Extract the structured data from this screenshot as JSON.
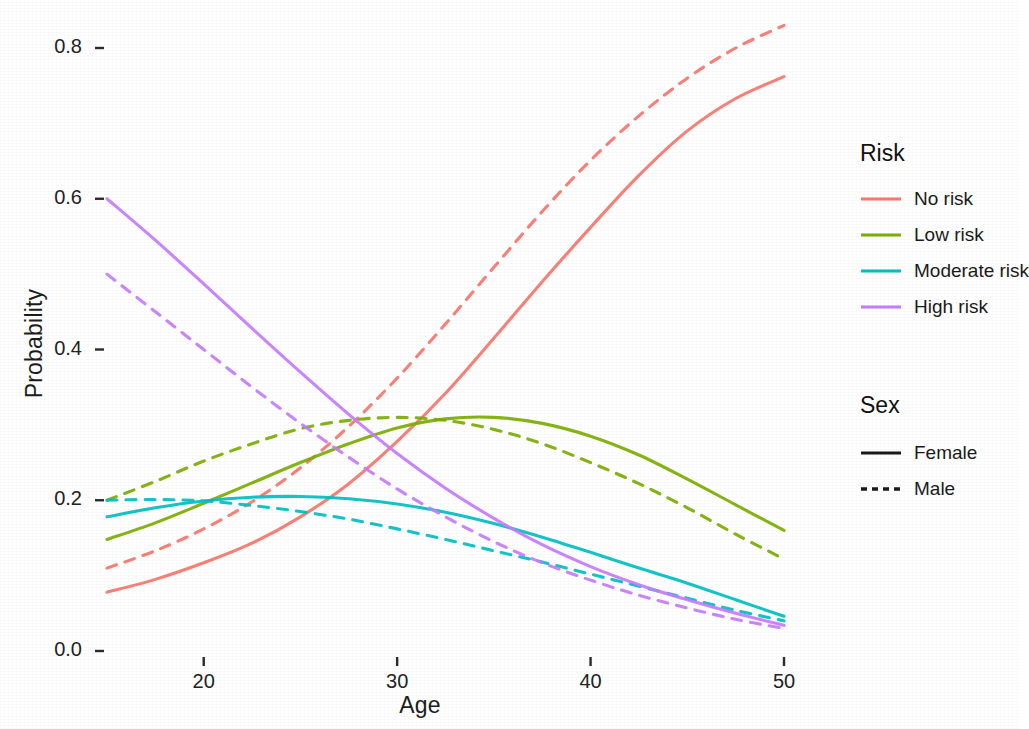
{
  "chart_data": {
    "type": "line",
    "title": "",
    "xlabel": "Age",
    "ylabel": "Probability",
    "xlim": [
      15,
      50
    ],
    "ylim": [
      0.0,
      0.85
    ],
    "xticks": [
      20,
      30,
      40,
      50
    ],
    "yticks": [
      "0.0",
      "0.2",
      "0.4",
      "0.6",
      "0.8"
    ],
    "grid": false,
    "legend_position": "right",
    "x": [
      15,
      17.5,
      20,
      22.5,
      25,
      27.5,
      30,
      32.5,
      35,
      37.5,
      40,
      42.5,
      45,
      47.5,
      50
    ],
    "series": [
      {
        "name": "No risk — Female",
        "risk": "No risk",
        "sex": "Female",
        "color": "#F8766D",
        "dash": "solid",
        "values": [
          0.078,
          0.095,
          0.117,
          0.143,
          0.178,
          0.222,
          0.278,
          0.342,
          0.415,
          0.49,
          0.562,
          0.631,
          0.69,
          0.733,
          0.762
        ]
      },
      {
        "name": "No risk — Male",
        "risk": "No risk",
        "sex": "Male",
        "color": "#F8766D",
        "dash": "dashed",
        "values": [
          0.11,
          0.133,
          0.162,
          0.198,
          0.243,
          0.298,
          0.362,
          0.434,
          0.509,
          0.583,
          0.651,
          0.71,
          0.76,
          0.8,
          0.83
        ]
      },
      {
        "name": "Low risk — Female",
        "risk": "Low risk",
        "sex": "Female",
        "color": "#7CAE00",
        "dash": "solid",
        "values": [
          0.148,
          0.17,
          0.196,
          0.223,
          0.25,
          0.275,
          0.296,
          0.308,
          0.31,
          0.302,
          0.285,
          0.26,
          0.228,
          0.194,
          0.16
        ]
      },
      {
        "name": "Low risk — Male",
        "risk": "Low risk",
        "sex": "Male",
        "color": "#7CAE00",
        "dash": "dashed",
        "values": [
          0.2,
          0.225,
          0.252,
          0.275,
          0.295,
          0.306,
          0.31,
          0.306,
          0.294,
          0.275,
          0.25,
          0.222,
          0.19,
          0.155,
          0.122
        ]
      },
      {
        "name": "Moderate risk — Female",
        "risk": "Moderate risk",
        "sex": "Female",
        "color": "#00BFC4",
        "dash": "solid",
        "values": [
          0.178,
          0.19,
          0.199,
          0.204,
          0.205,
          0.202,
          0.195,
          0.184,
          0.169,
          0.151,
          0.131,
          0.11,
          0.09,
          0.068,
          0.046
        ]
      },
      {
        "name": "Moderate risk — Male",
        "risk": "Moderate risk",
        "sex": "Male",
        "color": "#00BFC4",
        "dash": "dashed",
        "values": [
          0.2,
          0.201,
          0.199,
          0.193,
          0.185,
          0.175,
          0.162,
          0.148,
          0.133,
          0.118,
          0.102,
          0.086,
          0.07,
          0.054,
          0.04
        ]
      },
      {
        "name": "High risk — Female",
        "risk": "High risk",
        "sex": "Female",
        "color": "#C77CFF",
        "dash": "solid",
        "values": [
          0.6,
          0.545,
          0.487,
          0.428,
          0.37,
          0.314,
          0.262,
          0.216,
          0.176,
          0.141,
          0.112,
          0.088,
          0.068,
          0.05,
          0.034
        ]
      },
      {
        "name": "High risk — Male",
        "risk": "High risk",
        "sex": "Male",
        "color": "#C77CFF",
        "dash": "dashed",
        "values": [
          0.5,
          0.45,
          0.4,
          0.35,
          0.302,
          0.257,
          0.215,
          0.178,
          0.145,
          0.117,
          0.094,
          0.074,
          0.057,
          0.042,
          0.03
        ]
      }
    ]
  },
  "axes": {
    "ylabel": "Probability",
    "xlabel": "Age",
    "yticks": [
      "0.8",
      "0.6",
      "0.4",
      "0.2",
      "0.0"
    ],
    "xticks": [
      "20",
      "30",
      "40",
      "50"
    ]
  },
  "legend": {
    "risk": {
      "title": "Risk",
      "items": [
        {
          "label": "No risk",
          "color": "#F8766D"
        },
        {
          "label": "Low risk",
          "color": "#7CAE00"
        },
        {
          "label": "Moderate risk",
          "color": "#00BFC4"
        },
        {
          "label": "High risk",
          "color": "#C77CFF"
        }
      ]
    },
    "sex": {
      "title": "Sex",
      "items": [
        {
          "label": "Female",
          "dash": "solid"
        },
        {
          "label": "Male",
          "dash": "dashed"
        }
      ]
    }
  }
}
